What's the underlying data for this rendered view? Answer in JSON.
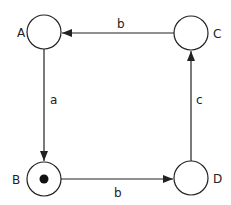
{
  "diagram": {
    "type": "state-transition / petri-net",
    "nodes": [
      {
        "id": "A",
        "label": "A",
        "cx": 44,
        "cy": 32,
        "r": 17,
        "token": false
      },
      {
        "id": "C",
        "label": "C",
        "cx": 191,
        "cy": 33,
        "r": 17,
        "token": false
      },
      {
        "id": "B",
        "label": "B",
        "cx": 44,
        "cy": 179,
        "r": 17,
        "token": true
      },
      {
        "id": "D",
        "label": "D",
        "cx": 191,
        "cy": 178,
        "r": 17,
        "token": false
      }
    ],
    "edges": [
      {
        "from": "A",
        "to": "B",
        "label": "a"
      },
      {
        "from": "B",
        "to": "D",
        "label": "b"
      },
      {
        "from": "D",
        "to": "C",
        "label": "c"
      },
      {
        "from": "C",
        "to": "A",
        "label": "b"
      }
    ],
    "colors": {
      "stroke": "#222222",
      "background": "#ffffff"
    }
  }
}
